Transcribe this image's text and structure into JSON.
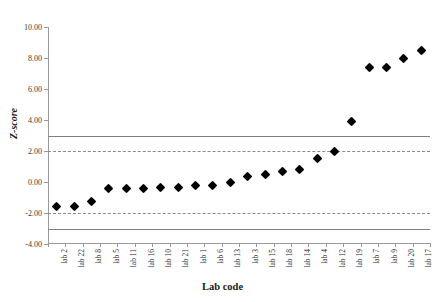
{
  "chart_data": {
    "type": "scatter",
    "title": "",
    "xlabel": "Lab code",
    "ylabel": "Z-score",
    "categories": [
      "lab 2",
      "lab 22",
      "lab 8",
      "lab 5",
      "lab 11",
      "lab 16",
      "lab 10",
      "lab 21",
      "lab 1",
      "lab 6",
      "lab 13",
      "lab 3",
      "lab 15",
      "lab 18",
      "lab 14",
      "lab 4",
      "lab 12",
      "lab 19",
      "lab 7",
      "lab 9",
      "lab 20",
      "lab 17"
    ],
    "values": [
      -1.6,
      -1.6,
      -1.25,
      -0.45,
      -0.45,
      -0.45,
      -0.35,
      -0.35,
      -0.25,
      -0.25,
      0.0,
      0.35,
      0.5,
      0.7,
      0.8,
      1.5,
      2.0,
      3.9,
      7.4,
      7.4,
      8.0,
      8.5
    ],
    "series": [
      {
        "name": "Z-score",
        "values": [
          -1.6,
          -1.6,
          -1.25,
          -0.45,
          -0.45,
          -0.45,
          -0.35,
          -0.35,
          -0.25,
          -0.25,
          0.0,
          0.35,
          0.5,
          0.7,
          0.8,
          1.5,
          2.0,
          3.9,
          7.4,
          7.4,
          8.0,
          8.5
        ]
      }
    ],
    "ylim": [
      -4.0,
      10.0
    ],
    "ytick_values": [
      10.0,
      8.0,
      6.0,
      4.0,
      2.0,
      0.0,
      -2.0,
      -4.0
    ],
    "ytick_labels": [
      "10.00",
      "8.00",
      "6.00",
      "4.00",
      "2.00",
      "0.00",
      "-2.00",
      "-4.00"
    ],
    "grid": false,
    "legend": "none",
    "reference_lines": [
      {
        "name": "action-limit-upper",
        "value": 3.0,
        "style": "solid",
        "color": "#808080"
      },
      {
        "name": "warning-limit-upper",
        "value": 2.0,
        "style": "dashed",
        "color": "#8c8c8c"
      },
      {
        "name": "warning-limit-lower",
        "value": -2.0,
        "style": "dashed",
        "color": "#8c8c8c"
      },
      {
        "name": "action-limit-lower",
        "value": -3.0,
        "style": "solid",
        "color": "#808080"
      }
    ],
    "marker": {
      "shape": "diamond",
      "color": "#000000"
    }
  }
}
